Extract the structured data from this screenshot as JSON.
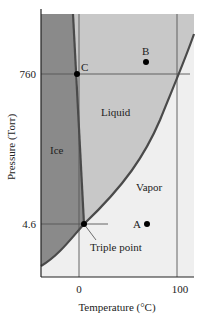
{
  "diagram": {
    "x_axis": {
      "label": "Temperature (°C)",
      "ticks": [
        "0",
        "100"
      ]
    },
    "y_axis": {
      "label": "Pressure (Torr)",
      "ticks": [
        "760",
        "4.6"
      ]
    },
    "regions": {
      "ice": {
        "label": "Ice",
        "color": "#8a8a8a"
      },
      "liquid": {
        "label": "Liquid",
        "color": "#c8c8c8"
      },
      "vapor": {
        "label": "Vapor",
        "color": "#efefef"
      }
    },
    "points": {
      "A": {
        "label": "A"
      },
      "B": {
        "label": "B"
      },
      "C": {
        "label": "C"
      },
      "triple": {
        "label": "Triple point"
      }
    },
    "colors": {
      "curve": "#4a4a4a",
      "gridline": "#555555",
      "axis": "#222222",
      "point": "#000000"
    }
  }
}
